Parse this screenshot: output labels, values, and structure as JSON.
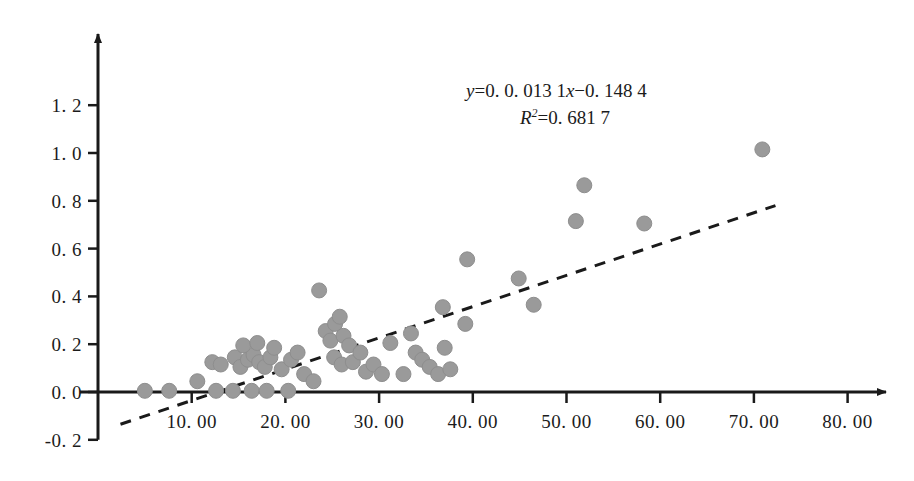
{
  "chart_data": {
    "type": "scatter",
    "title": "",
    "xlabel": "",
    "ylabel": "",
    "xlim": [
      0,
      85
    ],
    "ylim": [
      -0.25,
      1.28
    ],
    "grid": false,
    "legend": false,
    "background_color": "#ffffff",
    "marker_color": "#9a9a9a",
    "marker_edge_color": "#8e8e8e",
    "marker_size_px": 15,
    "axis_color": "#1a1a1a",
    "trendline_color": "#1a1a1a",
    "trendline_style": "dashed",
    "xticks": [
      10,
      20,
      30,
      40,
      50,
      60,
      70,
      80
    ],
    "xtick_labels": [
      "10. 00",
      "20. 00",
      "30. 00",
      "40. 00",
      "50. 00",
      "60. 00",
      "70. 00",
      "80. 00"
    ],
    "yticks": [
      -0.2,
      0.0,
      0.2,
      0.4,
      0.6,
      0.8,
      1.0,
      1.2
    ],
    "ytick_labels": [
      "-0. 2",
      "0. 0",
      "0. 2",
      "0. 4",
      "0. 6",
      "0. 8",
      "1. 0",
      "1. 2"
    ],
    "annotations": [
      {
        "id": "equation",
        "text": "y=0. 0. 013 1x-0. 148 4"
      },
      {
        "id": "r_squared",
        "text": "R2=0. 681 7"
      }
    ],
    "trendline": {
      "x_start": 2.4,
      "y_start": -0.135,
      "x_end": 72.3,
      "y_end": 0.78
    },
    "points": [
      [
        5.0,
        0.005
      ],
      [
        7.6,
        0.005
      ],
      [
        10.6,
        0.045
      ],
      [
        12.6,
        0.005
      ],
      [
        14.4,
        0.005
      ],
      [
        16.4,
        0.005
      ],
      [
        18.0,
        0.005
      ],
      [
        20.3,
        0.005
      ],
      [
        12.2,
        0.125
      ],
      [
        13.1,
        0.115
      ],
      [
        14.6,
        0.145
      ],
      [
        15.2,
        0.105
      ],
      [
        16.0,
        0.135
      ],
      [
        16.6,
        0.155
      ],
      [
        17.2,
        0.125
      ],
      [
        17.8,
        0.105
      ],
      [
        18.4,
        0.145
      ],
      [
        15.5,
        0.195
      ],
      [
        17.0,
        0.205
      ],
      [
        18.8,
        0.185
      ],
      [
        19.6,
        0.095
      ],
      [
        20.6,
        0.135
      ],
      [
        21.3,
        0.165
      ],
      [
        22.0,
        0.075
      ],
      [
        23.0,
        0.045
      ],
      [
        23.6,
        0.425
      ],
      [
        24.3,
        0.255
      ],
      [
        24.8,
        0.215
      ],
      [
        25.3,
        0.285
      ],
      [
        25.8,
        0.315
      ],
      [
        26.2,
        0.235
      ],
      [
        26.8,
        0.195
      ],
      [
        25.2,
        0.145
      ],
      [
        26.0,
        0.115
      ],
      [
        27.2,
        0.125
      ],
      [
        28.0,
        0.165
      ],
      [
        28.6,
        0.085
      ],
      [
        29.4,
        0.115
      ],
      [
        30.3,
        0.075
      ],
      [
        31.2,
        0.205
      ],
      [
        32.6,
        0.075
      ],
      [
        33.4,
        0.245
      ],
      [
        33.9,
        0.165
      ],
      [
        34.6,
        0.135
      ],
      [
        35.4,
        0.105
      ],
      [
        36.3,
        0.075
      ],
      [
        37.0,
        0.185
      ],
      [
        37.6,
        0.095
      ],
      [
        36.8,
        0.355
      ],
      [
        39.2,
        0.285
      ],
      [
        39.4,
        0.555
      ],
      [
        44.9,
        0.475
      ],
      [
        46.5,
        0.365
      ],
      [
        51.0,
        0.715
      ],
      [
        51.9,
        0.865
      ],
      [
        58.3,
        0.705
      ],
      [
        70.9,
        1.015
      ]
    ],
    "n_points": 57
  }
}
